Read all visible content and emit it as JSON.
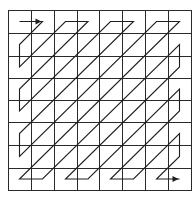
{
  "diagram": {
    "type": "zigzag-scan",
    "grid": {
      "rows": 8,
      "cols": 8,
      "x_lines": [
        8,
        31,
        54,
        77,
        99,
        122,
        145,
        168,
        191
      ],
      "y_lines": [
        10,
        33,
        56,
        78,
        100,
        122,
        145,
        168,
        190
      ],
      "line_color": "#2a2a2a"
    },
    "path": {
      "color": "#1e1e1e",
      "start_cell": [
        0,
        0
      ],
      "end_cell": [
        7,
        7
      ],
      "start_arrow": true,
      "end_arrow": true,
      "vertices": [
        [
          0,
          0
        ],
        [
          0,
          1
        ],
        [
          1,
          0
        ],
        [
          2,
          0
        ],
        [
          0,
          2
        ],
        [
          0,
          3
        ],
        [
          3,
          0
        ],
        [
          4,
          0
        ],
        [
          0,
          4
        ],
        [
          0,
          5
        ],
        [
          5,
          0
        ],
        [
          6,
          0
        ],
        [
          0,
          6
        ],
        [
          0,
          7
        ],
        [
          7,
          0
        ],
        [
          7,
          1
        ],
        [
          1,
          7
        ],
        [
          2,
          7
        ],
        [
          7,
          2
        ],
        [
          7,
          3
        ],
        [
          3,
          7
        ],
        [
          4,
          7
        ],
        [
          7,
          4
        ],
        [
          7,
          5
        ],
        [
          5,
          7
        ],
        [
          6,
          7
        ],
        [
          7,
          6
        ],
        [
          7,
          7
        ]
      ]
    }
  }
}
